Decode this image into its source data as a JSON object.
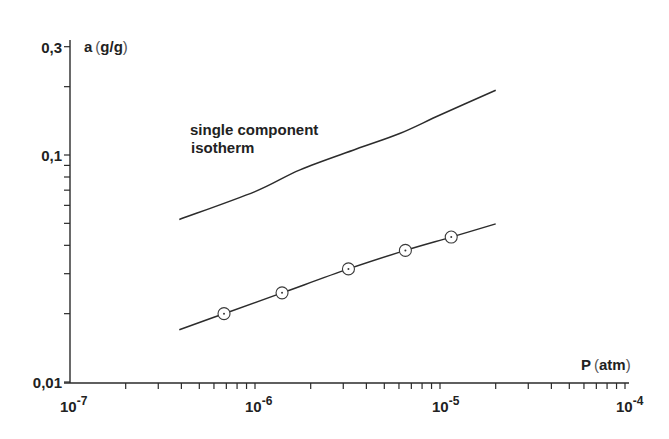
{
  "chart_data": {
    "type": "line",
    "title": "",
    "xlabel": "P (atm)",
    "ylabel": "a (g/g)",
    "xscale": "log",
    "yscale": "log",
    "xlim": [
      1e-07,
      0.0001
    ],
    "ylim": [
      0.01,
      0.3
    ],
    "grid": false,
    "legend": null,
    "x_tick_labels": [
      "10-7",
      "10-6",
      "10-5",
      "10-4"
    ],
    "x_tick_values": [
      1e-07,
      1e-06,
      1e-05,
      0.0001
    ],
    "y_tick_labels": [
      "0,01",
      "0,1",
      "0,3"
    ],
    "y_tick_values": [
      0.01,
      0.1,
      0.3
    ],
    "annotations": [
      {
        "text": "single component",
        "line": 1
      },
      {
        "text": "isotherm",
        "line": 2
      }
    ],
    "series": [
      {
        "name": "single component isotherm",
        "style": "line",
        "x": [
          3.9e-07,
          1e-06,
          1.75e-06,
          3.5e-06,
          6e-06,
          1e-05,
          2e-05
        ],
        "y": [
          0.052,
          0.069,
          0.086,
          0.106,
          0.124,
          0.15,
          0.193
        ]
      },
      {
        "name": "mixture fit",
        "style": "line",
        "x": [
          3.9e-07,
          6.8e-07,
          1.4e-06,
          3.2e-06,
          6.5e-06,
          1.15e-05,
          2e-05
        ],
        "y": [
          0.017,
          0.02,
          0.0247,
          0.0315,
          0.038,
          0.0435,
          0.0497
        ]
      },
      {
        "name": "measured points",
        "style": "marker-circle-dot",
        "x": [
          6.8e-07,
          1.4e-06,
          3.2e-06,
          6.5e-06,
          1.15e-05
        ],
        "y": [
          0.02,
          0.0247,
          0.0315,
          0.038,
          0.0435
        ]
      }
    ]
  },
  "labels": {
    "y_axis_var": "a",
    "y_axis_unit": "g/g",
    "x_axis_var": "P",
    "x_axis_unit": "atm",
    "annot_line1": "single component",
    "annot_line2": "isotherm",
    "y_ticks": [
      "0,3",
      "0,1",
      "0,01"
    ],
    "x_ticks": [
      {
        "base": "10",
        "exp": "-7"
      },
      {
        "base": "10",
        "exp": "-6"
      },
      {
        "base": "10",
        "exp": "-5"
      },
      {
        "base": "10",
        "exp": "-4"
      }
    ]
  }
}
